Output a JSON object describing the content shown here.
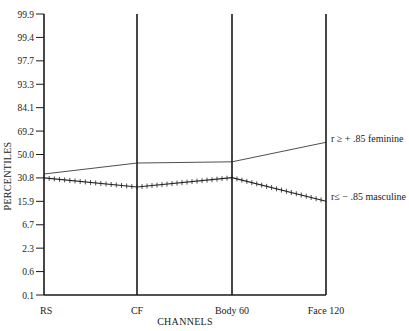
{
  "chart_data": {
    "type": "line",
    "title": "",
    "xlabel": "CHANNELS",
    "ylabel": "PERCENTILES",
    "categories": [
      "RS",
      "CF",
      "Body 60",
      "Face 120"
    ],
    "y_ticks": [
      "99.9",
      "99.4",
      "97.7",
      "93.3",
      "84.1",
      "69.2",
      "50.0",
      "30.8",
      "15.9",
      "6.7",
      "2.3",
      "0.6",
      "0.1"
    ],
    "y_scale": "probability (normal percentile)",
    "ylim": [
      0.1,
      99.9
    ],
    "grid": false,
    "legend_position": "right, inline at line ends",
    "series": [
      {
        "name": "r ≥ + .85 feminine",
        "style": "thin solid line",
        "values": [
          34,
          43,
          44,
          60
        ]
      },
      {
        "name": "r≤ − .85 masculine",
        "style": "hatched line (cross marks)",
        "values": [
          30.8,
          25,
          31,
          16
        ]
      }
    ]
  },
  "labels": {
    "xlabel": "CHANNELS",
    "ylabel": "PERCENTILES",
    "feminine": "r ≥ + .85 feminine",
    "masculine": "r≤ − .85 masculine"
  },
  "colors": {
    "line": "#222222",
    "axis": "#1a1a1a",
    "background": "#ffffff"
  }
}
